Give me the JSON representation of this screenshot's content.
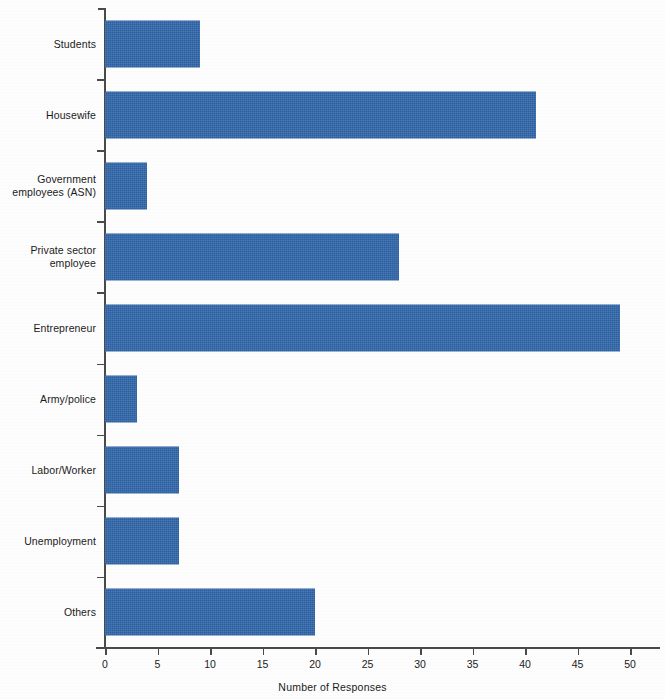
{
  "chart_data": {
    "type": "bar",
    "orientation": "horizontal",
    "title": "",
    "xlabel": "Number of Responses",
    "ylabel": "",
    "categories": [
      "Students",
      "Housewife",
      "Government employees (ASN)",
      "Private sector employee",
      "Entrepreneur",
      "Army/police",
      "Labor/Worker",
      "Unemployment",
      "Others"
    ],
    "category_lines": [
      [
        "Students"
      ],
      [
        "Housewife"
      ],
      [
        "Government",
        "employees (ASN)"
      ],
      [
        "Private sector",
        "employee"
      ],
      [
        "Entrepreneur"
      ],
      [
        "Army/police"
      ],
      [
        "Labor/Worker"
      ],
      [
        "Unemployment"
      ],
      [
        "Others"
      ]
    ],
    "values": [
      9,
      41,
      4,
      28,
      49,
      3,
      7,
      7,
      20
    ],
    "xlim": [
      0,
      50
    ],
    "xticks": [
      0,
      5,
      10,
      15,
      20,
      25,
      30,
      35,
      40,
      45,
      50
    ],
    "xtick_labels": [
      "0",
      "5",
      "10",
      "15",
      "20",
      "25",
      "30",
      "35",
      "40",
      "45",
      "50"
    ],
    "grid": false,
    "legend": null,
    "bar_color": "#3268ac",
    "axis_color": "#4a4a4a",
    "background_color": "#ffffff"
  }
}
